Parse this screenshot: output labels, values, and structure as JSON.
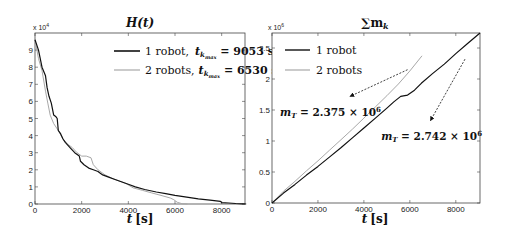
{
  "chart_data": [
    {
      "type": "line",
      "title": "H(t)",
      "xlabel": "t [s]",
      "ylabel": "",
      "y_multiplier": "x 10^4",
      "xlim": [
        0,
        9000
      ],
      "ylim": [
        0,
        10
      ],
      "xticks": [
        0,
        2000,
        4000,
        6000,
        8000
      ],
      "yticks": [
        0,
        1,
        2,
        3,
        4,
        5,
        6,
        7,
        8,
        9
      ],
      "grid": false,
      "legend_position": "upper right",
      "series": [
        {
          "name": "1 robot,  t_kmax = 9053 s",
          "color": "#111111",
          "x": [
            0,
            150,
            300,
            450,
            520,
            600,
            700,
            800,
            900,
            950,
            1000,
            1050,
            1100,
            1200,
            1300,
            1500,
            1700,
            1900,
            1950,
            2100,
            2300,
            2500,
            2700,
            2800,
            2900,
            3100,
            3400,
            3700,
            4000,
            4300,
            4700,
            5200,
            5600,
            6000,
            6500,
            7000,
            7500,
            7950,
            8000,
            8300,
            8600,
            8900,
            9053
          ],
          "y": [
            9.6,
            9.0,
            8.0,
            7.5,
            6.8,
            6.3,
            5.9,
            5.2,
            5.1,
            5.0,
            4.3,
            4.2,
            4.1,
            3.8,
            3.6,
            3.3,
            3.0,
            2.8,
            2.5,
            2.3,
            2.1,
            2.0,
            1.9,
            1.8,
            1.7,
            1.6,
            1.45,
            1.3,
            1.15,
            1.0,
            0.85,
            0.7,
            0.6,
            0.5,
            0.4,
            0.3,
            0.22,
            0.15,
            0.08,
            0.06,
            0.03,
            0.01,
            0.0
          ]
        },
        {
          "name": "2 robots, t_kmax = 6530 s",
          "color": "#a8a8a8",
          "x": [
            0,
            150,
            300,
            450,
            550,
            650,
            800,
            1000,
            1200,
            1400,
            1600,
            1800,
            2000,
            2200,
            2400,
            2500,
            2700,
            3000,
            3300,
            3600,
            3900,
            4200,
            4600,
            5000,
            5400,
            5800,
            5950,
            6100,
            6300,
            6530
          ],
          "y": [
            9.6,
            8.5,
            7.8,
            6.6,
            5.9,
            5.2,
            4.7,
            4.3,
            3.8,
            3.5,
            3.3,
            3.0,
            2.8,
            2.8,
            2.7,
            2.3,
            2.0,
            1.7,
            1.5,
            1.35,
            1.2,
            0.95,
            0.8,
            0.65,
            0.5,
            0.35,
            0.25,
            0.1,
            0.02,
            0.0
          ]
        }
      ]
    },
    {
      "type": "line",
      "title": "Σ m_k",
      "xlabel": "t [s]",
      "ylabel": "",
      "y_multiplier": "x 10^6",
      "xlim": [
        0,
        9053
      ],
      "ylim": [
        0,
        2.742
      ],
      "xticks": [
        0,
        2000,
        4000,
        6000,
        8000
      ],
      "yticks": [
        0,
        0.5,
        1,
        1.5,
        2,
        2.5
      ],
      "grid": false,
      "legend_position": "upper left",
      "series": [
        {
          "name": "1 robot",
          "color": "#111111",
          "x": [
            0,
            500,
            1000,
            1500,
            2000,
            2500,
            3000,
            3500,
            4000,
            4500,
            5000,
            5300,
            5600,
            5900,
            6200,
            6500,
            7000,
            7500,
            8000,
            8500,
            9053
          ],
          "y": [
            0,
            0.16,
            0.3,
            0.45,
            0.59,
            0.74,
            0.89,
            1.05,
            1.21,
            1.37,
            1.53,
            1.63,
            1.72,
            1.74,
            1.82,
            1.93,
            2.09,
            2.24,
            2.41,
            2.57,
            2.742
          ]
        },
        {
          "name": "2 robots",
          "color": "#a8a8a8",
          "x": [
            0,
            500,
            1000,
            1500,
            2000,
            2500,
            3000,
            3500,
            4000,
            4500,
            5000,
            5500,
            6000,
            6530
          ],
          "y": [
            0,
            0.19,
            0.35,
            0.52,
            0.68,
            0.85,
            1.02,
            1.19,
            1.37,
            1.55,
            1.73,
            1.92,
            2.13,
            2.375
          ]
        }
      ],
      "annotations": [
        {
          "text_main": "m",
          "text_sub": "T",
          "text_value": " = 2.375 × 10",
          "text_exp": "6",
          "arrow_from": [
            5900,
            2.15
          ],
          "arrow_to": [
            3400,
            1.72
          ],
          "text_at": [
            350,
            1.4
          ]
        },
        {
          "text_main": "m",
          "text_sub": "T",
          "text_value": " = 2.742 × 10",
          "text_exp": "6",
          "arrow_from": [
            8400,
            2.32
          ],
          "arrow_to": [
            6900,
            1.33
          ],
          "text_at": [
            4750,
            1.02
          ]
        }
      ]
    }
  ],
  "labels": {
    "left_title": "H(t)",
    "right_title": "∑m",
    "right_title_sub": "k",
    "xlabel_t": "t",
    "xlabel_unit": "[s]",
    "left_mult": "x 10",
    "left_mult_exp": "4",
    "right_mult": "x 10",
    "right_mult_exp": "6",
    "leg1_a": "1 robot,",
    "leg1_b": "t",
    "leg1_sub": "k",
    "leg1_subsub": "max",
    "leg1_c": " = 9053 s",
    "leg2_a": "2 robots,",
    "leg2_b": "t",
    "leg2_sub": "k",
    "leg2_subsub": "max",
    "leg2_c": " = 6530 s",
    "rleg1": "1 robot",
    "rleg2": "2 robots"
  }
}
